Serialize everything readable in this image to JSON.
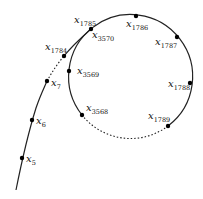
{
  "diagram": {
    "colors": {
      "stroke": "#222222",
      "point": "#000000",
      "background": "#ffffff"
    },
    "tail_points": [
      {
        "id": "x5",
        "base": "x",
        "sub": "5"
      },
      {
        "id": "x6",
        "base": "x",
        "sub": "6"
      },
      {
        "id": "x7",
        "base": "x",
        "sub": "7"
      },
      {
        "id": "x1784",
        "base": "x",
        "sub": "1784"
      }
    ],
    "junction_point": {
      "id": "x1785",
      "base": "x",
      "sub": "1785"
    },
    "cycle_points": [
      {
        "id": "x1786",
        "base": "x",
        "sub": "1786"
      },
      {
        "id": "x1787",
        "base": "x",
        "sub": "1787"
      },
      {
        "id": "x1788",
        "base": "x",
        "sub": "1788"
      },
      {
        "id": "x1789",
        "base": "x",
        "sub": "1789"
      },
      {
        "id": "x3568",
        "base": "x",
        "sub": "3568"
      },
      {
        "id": "x3569",
        "base": "x",
        "sub": "3569"
      },
      {
        "id": "x3570",
        "base": "x",
        "sub": "3570"
      }
    ],
    "elided_segments": [
      "x7 to x1784 (dotted)",
      "x1789 to x3568 (dotted)"
    ]
  }
}
